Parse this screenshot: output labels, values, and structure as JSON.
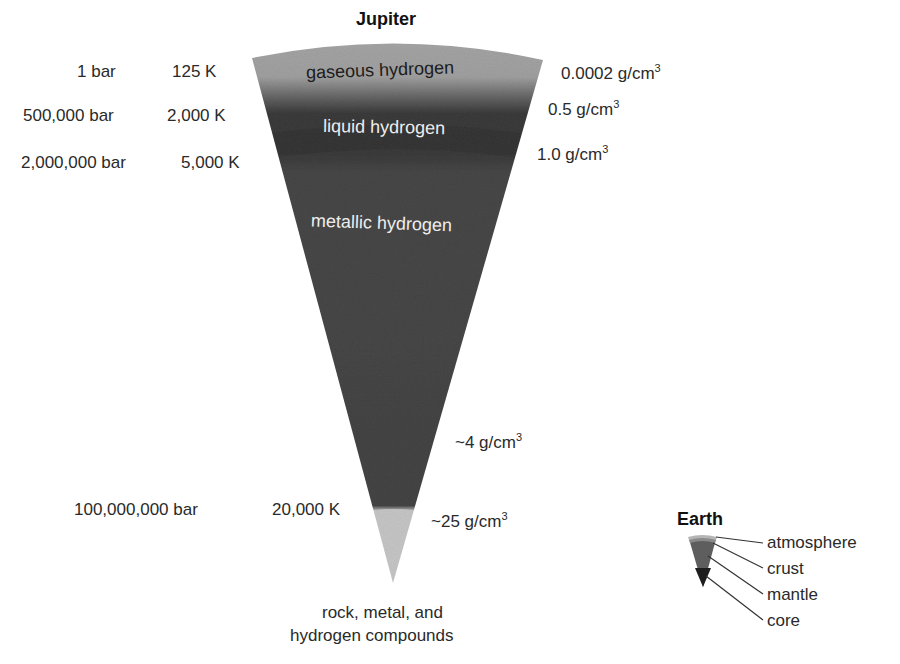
{
  "jupiter": {
    "title": "Jupiter",
    "layers": [
      {
        "name": "gaseous hydrogen",
        "color": "#a6a6a6",
        "text_color": "#1c1c1c"
      },
      {
        "name": "liquid hydrogen",
        "color": "#3f3f3f",
        "text_color": "#eeeeee"
      },
      {
        "name": "metallic hydrogen",
        "color": "#454545",
        "text_color": "#eeeeee"
      },
      {
        "name": "rock, metal, and hydrogen compounds",
        "color": "#c9c9c9"
      }
    ],
    "core_label_line1": "rock, metal, and",
    "core_label_line2": "hydrogen compounds",
    "pressures": [
      "1 bar",
      "500,000 bar",
      "2,000,000 bar",
      "100,000,000 bar"
    ],
    "temperatures": [
      "125 K",
      "2,000 K",
      "5,000 K",
      "20,000 K"
    ],
    "densities": [
      {
        "value": "0.0002 g/cm",
        "exp": "3"
      },
      {
        "value": "0.5 g/cm",
        "exp": "3"
      },
      {
        "value": "1.0 g/cm",
        "exp": "3"
      },
      {
        "value": "~4 g/cm",
        "exp": "3"
      },
      {
        "value": "~25 g/cm",
        "exp": "3"
      }
    ]
  },
  "earth": {
    "title": "Earth",
    "layers": [
      "atmosphere",
      "crust",
      "mantle",
      "core"
    ],
    "colors": {
      "atmosphere": "#b5b5b5",
      "crust": "#8a8a8a",
      "mantle": "#5e5e5e",
      "core": "#1e1e1e"
    }
  }
}
